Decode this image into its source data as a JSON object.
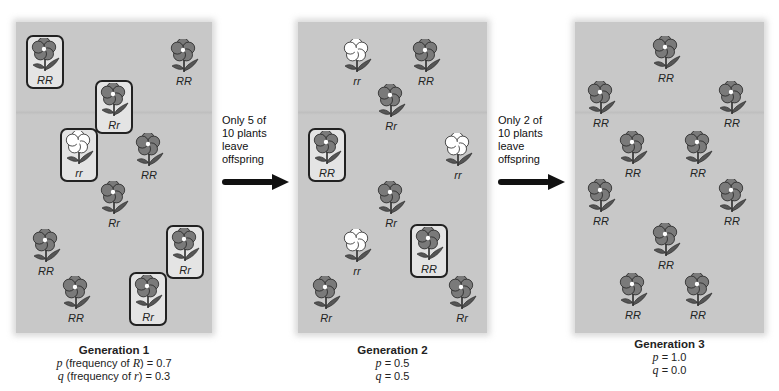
{
  "colors": {
    "panel_bg": "#c8c8c8",
    "petal_dominant": "#7a7a7a",
    "petal_recessive": "#ffffff",
    "leaf": "#555555",
    "outline": "#222222",
    "arrow": "#111111"
  },
  "generations": [
    {
      "title": "Generation 1",
      "p_label": "p",
      "p_text": " (frequency of ",
      "p_allele": "R",
      "p_value": ") = 0.7",
      "q_label": "q",
      "q_text": " (frequency of ",
      "q_allele": "r",
      "q_value": ") = 0.3",
      "plants": [
        {
          "genotype": "RR",
          "selected": true,
          "x": 26,
          "y": 35
        },
        {
          "genotype": "RR",
          "selected": false,
          "x": 165,
          "y": 38
        },
        {
          "genotype": "Rr",
          "selected": true,
          "x": 95,
          "y": 80
        },
        {
          "genotype": "rr",
          "selected": true,
          "x": 60,
          "y": 128
        },
        {
          "genotype": "RR",
          "selected": false,
          "x": 130,
          "y": 132
        },
        {
          "genotype": "Rr",
          "selected": false,
          "x": 95,
          "y": 180
        },
        {
          "genotype": "RR",
          "selected": false,
          "x": 27,
          "y": 228
        },
        {
          "genotype": "Rr",
          "selected": true,
          "x": 166,
          "y": 225
        },
        {
          "genotype": "RR",
          "selected": false,
          "x": 57,
          "y": 275
        },
        {
          "genotype": "Rr",
          "selected": true,
          "x": 129,
          "y": 272
        }
      ]
    },
    {
      "title": "Generation 2",
      "p_label": "p",
      "p_value": " = 0.5",
      "q_label": "q",
      "q_value": " = 0.5",
      "plants": [
        {
          "genotype": "rr",
          "selected": false,
          "x": 338,
          "y": 38
        },
        {
          "genotype": "RR",
          "selected": false,
          "x": 407,
          "y": 38
        },
        {
          "genotype": "Rr",
          "selected": false,
          "x": 372,
          "y": 83
        },
        {
          "genotype": "RR",
          "selected": true,
          "x": 308,
          "y": 128
        },
        {
          "genotype": "rr",
          "selected": false,
          "x": 439,
          "y": 132
        },
        {
          "genotype": "Rr",
          "selected": false,
          "x": 372,
          "y": 180
        },
        {
          "genotype": "rr",
          "selected": false,
          "x": 338,
          "y": 228
        },
        {
          "genotype": "RR",
          "selected": true,
          "x": 410,
          "y": 224
        },
        {
          "genotype": "Rr",
          "selected": false,
          "x": 307,
          "y": 275
        },
        {
          "genotype": "Rr",
          "selected": false,
          "x": 443,
          "y": 275
        }
      ]
    },
    {
      "title": "Generation 3",
      "p_label": "p",
      "p_value": " = 1.0",
      "q_label": "q",
      "q_value": " = 0.0",
      "plants": [
        {
          "genotype": "RR",
          "selected": false,
          "x": 647,
          "y": 35
        },
        {
          "genotype": "RR",
          "selected": false,
          "x": 582,
          "y": 80
        },
        {
          "genotype": "RR",
          "selected": false,
          "x": 713,
          "y": 80
        },
        {
          "genotype": "RR",
          "selected": false,
          "x": 614,
          "y": 130
        },
        {
          "genotype": "RR",
          "selected": false,
          "x": 679,
          "y": 130
        },
        {
          "genotype": "RR",
          "selected": false,
          "x": 582,
          "y": 178
        },
        {
          "genotype": "RR",
          "selected": false,
          "x": 713,
          "y": 178
        },
        {
          "genotype": "RR",
          "selected": false,
          "x": 647,
          "y": 222
        },
        {
          "genotype": "RR",
          "selected": false,
          "x": 614,
          "y": 272
        },
        {
          "genotype": "RR",
          "selected": false,
          "x": 679,
          "y": 272
        }
      ]
    }
  ],
  "transitions": [
    {
      "line1": "Only 5 of",
      "line2": "10 plants",
      "line3": "leave",
      "line4": "offspring"
    },
    {
      "line1": "Only 2 of",
      "line2": "10 plants",
      "line3": "leave",
      "line4": "offspring"
    }
  ]
}
